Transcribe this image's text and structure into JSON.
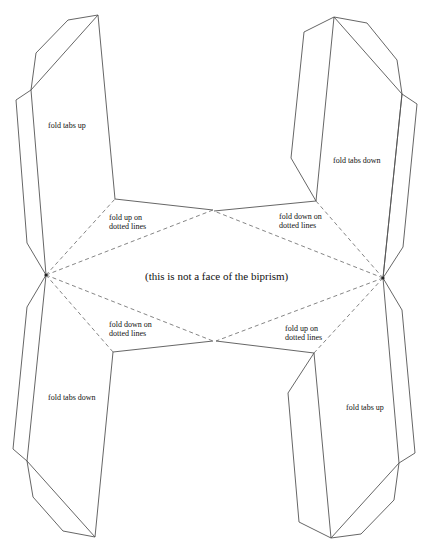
{
  "diagram": {
    "center_note": "(this is not a face of the biprism)",
    "labels": {
      "top_left_tabs": "fold  tabs up",
      "top_right_tabs": "fold tabs down",
      "bottom_left_tabs": "fold  tabs down",
      "bottom_right_tabs": "fold tabs  up",
      "top_left_fold": [
        "fold  up on",
        "dotted lines"
      ],
      "top_right_fold": [
        "fold  down on",
        "dotted lines"
      ],
      "bottom_left_fold": [
        "fold  down on",
        "dotted lines"
      ],
      "bottom_right_fold": [
        "fold  up on",
        "dotted lines"
      ]
    },
    "colors": {
      "line": "#555555",
      "dashed": "#666666",
      "background": "#ffffff"
    }
  }
}
